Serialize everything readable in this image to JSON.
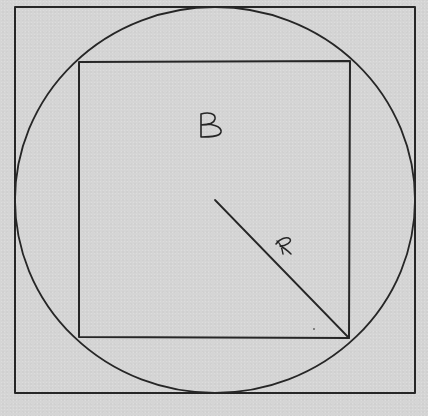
{
  "figure": {
    "background_color": "#d5d5d5",
    "line_color": "#262626",
    "outer_square": {
      "x": 15,
      "y": 7,
      "width": 400,
      "height": 386
    },
    "circle": {
      "cx": 215,
      "cy": 200,
      "rx": 200,
      "ry": 193
    },
    "inner_square": {
      "x1": 79,
      "y1": 62,
      "x2": 349,
      "y2": 338
    },
    "radius_line": {
      "x1": 215,
      "y1": 200,
      "x2": 349,
      "y2": 338
    },
    "labels": {
      "square_label": "B",
      "radius_label": "R"
    }
  }
}
